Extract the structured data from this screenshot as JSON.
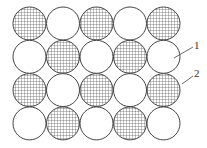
{
  "diagram": {
    "type": "circle-packing-checkerboard",
    "rows": 4,
    "cols": 5,
    "pattern": [
      [
        "hatched",
        "white",
        "hatched",
        "white",
        "hatched"
      ],
      [
        "white",
        "hatched",
        "white",
        "hatched",
        "white"
      ],
      [
        "hatched",
        "white",
        "hatched",
        "white",
        "hatched"
      ],
      [
        "white",
        "hatched",
        "white",
        "hatched",
        "white"
      ]
    ],
    "colors": {
      "stroke": "#444444",
      "hatch": "#555555",
      "fill_white": "#ffffff"
    },
    "labels": [
      {
        "text": "1",
        "target": "white circle, row 2, col 5"
      },
      {
        "text": "2",
        "target": "hatched circle, row 3, col 5"
      }
    ]
  }
}
